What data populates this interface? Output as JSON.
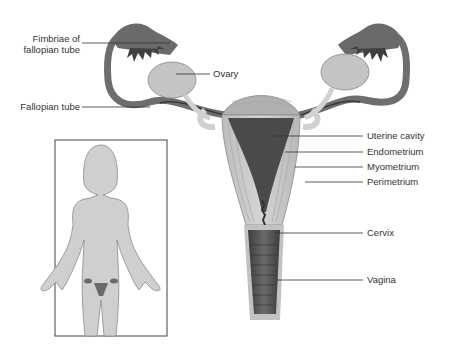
{
  "diagram": {
    "labels": {
      "fimbriae_line1": "Fimbriae of",
      "fimbriae_line2": "fallopian tube",
      "ovary": "Ovary",
      "fallopian_tube": "Fallopian tube",
      "uterine_cavity": "Uterine cavity",
      "endometrium": "Endometrium",
      "myometrium": "Myometrium",
      "perimetrium": "Perimetrium",
      "cervix": "Cervix",
      "vagina": "Vagina"
    },
    "inset": {
      "description": "Female body silhouette showing location of reproductive organs"
    },
    "colors": {
      "tissue_light": "#c9c9c9",
      "tissue_mid": "#a8a8a8",
      "tissue_dark": "#5a5a5a",
      "cavity": "#444444",
      "leader_line": "#333333",
      "body_fill": "#cfcfcf"
    }
  }
}
